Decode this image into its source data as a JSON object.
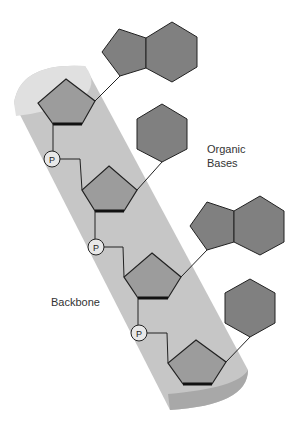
{
  "diagram": {
    "labels": {
      "organic_bases_line1": "Organic",
      "organic_bases_line2": "Bases",
      "backbone": "Backbone"
    },
    "phosphate_symbol": "P",
    "colors": {
      "background": "#ffffff",
      "cylinder_body": "#c6c6c6",
      "cylinder_top": "#e0e0e0",
      "cylinder_bottom": "#a8a8a8",
      "sugar_fill": "#9c9c9c",
      "base_fill": "#808080",
      "stroke": "#222222",
      "phosphate_fill": "#e8e8e8",
      "text": "#333333"
    },
    "units": [
      {
        "sugar": "pentagon-1",
        "base": "purine",
        "phosphate_below": true
      },
      {
        "sugar": "pentagon-2",
        "base": "pyrimidine",
        "phosphate_below": true
      },
      {
        "sugar": "pentagon-3",
        "base": "purine",
        "phosphate_below": true
      },
      {
        "sugar": "pentagon-4",
        "base": "pyrimidine",
        "phosphate_below": false
      }
    ]
  }
}
